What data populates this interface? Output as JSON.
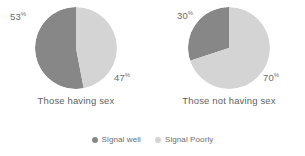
{
  "chart_data": [
    {
      "type": "pie",
      "title": "Those having sex",
      "categories": [
        "Signal well",
        "Signal Poorly"
      ],
      "values": [
        53,
        47
      ],
      "labels": [
        "53",
        "47"
      ],
      "unit": "%",
      "colors": [
        "#878787",
        "#d4d4d4"
      ],
      "start_angle_deg": 0,
      "direction": "counterclockwise"
    },
    {
      "type": "pie",
      "title": "Those not having sex",
      "categories": [
        "Signal well",
        "Signal Poorly"
      ],
      "values": [
        30,
        70
      ],
      "labels": [
        "30",
        "70"
      ],
      "unit": "%",
      "colors": [
        "#878787",
        "#d4d4d4"
      ],
      "start_angle_deg": 0,
      "direction": "counterclockwise"
    }
  ],
  "legend": {
    "position": "bottom-center",
    "items": [
      {
        "label": "Signal well",
        "color": "#878787"
      },
      {
        "label": "Signal Poorly",
        "color": "#d4d4d4"
      }
    ]
  },
  "style": {
    "background": "#ffffff",
    "text_color": "#6b6b6b"
  }
}
